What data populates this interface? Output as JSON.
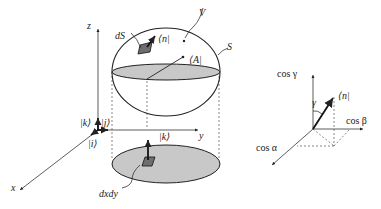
{
  "figure": {
    "main": {
      "labels": {
        "z_axis": "z",
        "y_axis": "y",
        "x_axis": "x",
        "volume": "V",
        "surface": "S",
        "surface_element": "dS",
        "normal_vector": "⟨n|",
        "vector_field": "⟨A|",
        "unit_k": "|k⟩",
        "unit_j": "|j⟩",
        "unit_i": "|i⟩",
        "projected_k": "|k⟩",
        "area_element": "dxdy"
      }
    },
    "inset": {
      "labels": {
        "cos_gamma": "cos γ",
        "cos_beta": "cos β",
        "cos_alpha": "cos α",
        "gamma_angle": "γ",
        "normal_vector": "⟨n|"
      }
    },
    "colors": {
      "shade": "#c8c8c8",
      "patch": "#6e6e6e",
      "line": "#222222"
    }
  }
}
